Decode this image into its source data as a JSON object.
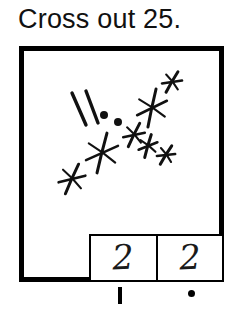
{
  "page": {
    "background_color": "#ffffff",
    "ink_color": "#000000"
  },
  "header": {
    "title": "Cross out 25."
  },
  "frame": {
    "border_color": "#000000",
    "border_width_px": 5,
    "fill_color": "#ffffff"
  },
  "drawing": {
    "description": "Hand-drawn tally slashes, dots and star-like crossed-out marks",
    "stroke_color": "#111111",
    "tally_slashes": [
      {
        "x1": 48,
        "y1": 42,
        "x2": 62,
        "y2": 74
      },
      {
        "x1": 62,
        "y1": 40,
        "x2": 74,
        "y2": 72
      }
    ],
    "dots": [
      {
        "cx": 80,
        "cy": 64,
        "r": 4.0
      },
      {
        "cx": 94,
        "cy": 71,
        "r": 4.0
      }
    ],
    "stars": [
      {
        "cx": 148,
        "cy": 31,
        "r": 11,
        "rot": 10
      },
      {
        "cx": 128,
        "cy": 57,
        "r": 18,
        "rot": -8
      },
      {
        "cx": 110,
        "cy": 84,
        "r": 12,
        "rot": 6
      },
      {
        "cx": 124,
        "cy": 95,
        "r": 11,
        "rot": -4
      },
      {
        "cx": 142,
        "cy": 104,
        "r": 10,
        "rot": 12
      },
      {
        "cx": 78,
        "cy": 102,
        "r": 19,
        "rot": -6
      },
      {
        "cx": 48,
        "cy": 128,
        "r": 15,
        "rot": 4
      }
    ]
  },
  "answers": {
    "cells": [
      {
        "value": "2"
      },
      {
        "value": "2"
      }
    ]
  },
  "below_frame_marks": {
    "tally_tick": {
      "label": "vertical tally mark"
    },
    "period_dot": {
      "label": "round ink dot"
    }
  }
}
